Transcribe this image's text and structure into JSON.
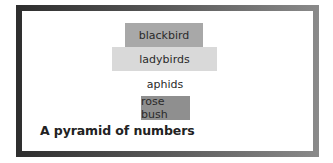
{
  "diagram": {
    "title": "A pyramid of numbers",
    "levels": [
      {
        "label": "blackbird",
        "color": "#a8a8a8",
        "left": 103,
        "top": 12,
        "width": 78,
        "height": 24
      },
      {
        "label": "ladybirds",
        "color": "#d9d9d9",
        "left": 90,
        "top": 36,
        "width": 105,
        "height": 24
      },
      {
        "label": "aphids",
        "color": "#ffffff",
        "left": 105,
        "top": 61,
        "width": 76,
        "height": 24
      },
      {
        "label": "rose bush",
        "color": "#8f8f8f",
        "left": 119,
        "top": 85,
        "width": 49,
        "height": 24
      }
    ],
    "frame_color_dark": "#2e2e2e",
    "frame_color_light": "#8a8a8a"
  }
}
